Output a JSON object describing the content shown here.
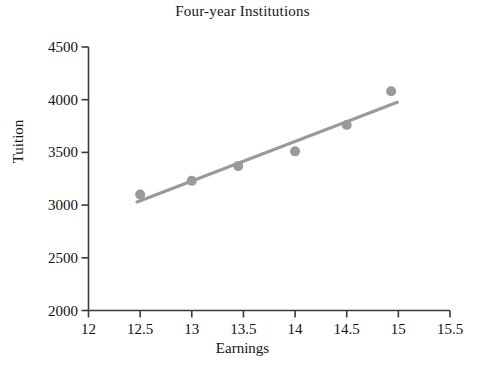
{
  "chart_data": {
    "type": "scatter",
    "title": "Four-year Institutions",
    "xlabel": "Earnings",
    "ylabel": "Tuition",
    "xlim": [
      12,
      15.5
    ],
    "ylim": [
      2000,
      4500
    ],
    "grid": false,
    "legend": "none",
    "xticks": [
      "12",
      "12.5",
      "13",
      "13.5",
      "14",
      "14.5",
      "15",
      "15.5"
    ],
    "xtick_values": [
      12,
      12.5,
      13,
      13.5,
      14,
      14.5,
      15,
      15.5
    ],
    "yticks": [
      "2000",
      "2500",
      "3000",
      "3500",
      "4000",
      "4500"
    ],
    "ytick_values": [
      2000,
      2500,
      3000,
      3500,
      4000,
      4500
    ],
    "series": [
      {
        "name": "Institutions",
        "type": "scatter",
        "marker": "circle",
        "color": "#9a9a9a",
        "x": [
          12.5,
          13.0,
          13.45,
          14.0,
          14.5,
          14.93
        ],
        "y": [
          3100,
          3230,
          3370,
          3510,
          3760,
          4080
        ]
      },
      {
        "name": "Trend line",
        "type": "line",
        "color": "#9a9a9a",
        "x": [
          12.47,
          14.99
        ],
        "y": [
          3030,
          3975
        ]
      }
    ],
    "points": [
      {
        "x": 12.5,
        "y": 3100
      },
      {
        "x": 13.0,
        "y": 3230
      },
      {
        "x": 13.45,
        "y": 3370
      },
      {
        "x": 14.0,
        "y": 3510
      },
      {
        "x": 14.5,
        "y": 3760
      },
      {
        "x": 14.93,
        "y": 4080
      }
    ],
    "colors": {
      "marker": "#9a9a9a",
      "line": "#9a9a9a",
      "axis": "#3a3a3a",
      "text": "#111111",
      "background": "#ffffff"
    }
  },
  "axis_ticks": {
    "y": [
      {
        "label": "4500",
        "top": 47
      },
      {
        "label": "4000",
        "top": 100
      },
      {
        "label": "3500",
        "top": 153
      },
      {
        "label": "3000",
        "top": 205
      },
      {
        "label": "2500",
        "top": 258
      },
      {
        "label": "2000",
        "top": 310
      }
    ],
    "x": [
      {
        "label": "12",
        "left": 88
      },
      {
        "label": "12.5",
        "left": 140
      },
      {
        "label": "13",
        "left": 192
      },
      {
        "label": "13.5",
        "left": 243
      },
      {
        "label": "14",
        "left": 295
      },
      {
        "label": "14.5",
        "left": 347
      },
      {
        "label": "15",
        "left": 398
      },
      {
        "label": "15.5",
        "left": 450
      }
    ]
  }
}
